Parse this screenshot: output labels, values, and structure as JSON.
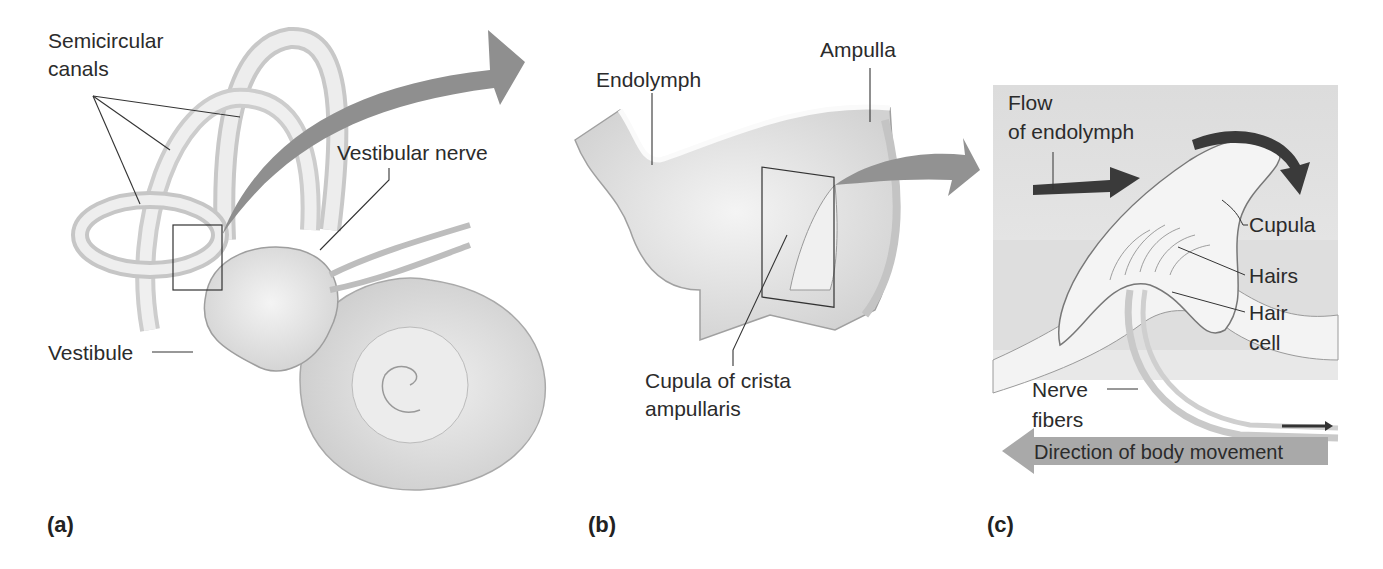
{
  "figure": {
    "panels": [
      {
        "id": "a",
        "letter": "(a)",
        "labels": {
          "semicircular_line1": "Semicircular",
          "semicircular_line2": "canals",
          "vestibular_nerve": "Vestibular nerve",
          "vestibule": "Vestibule"
        }
      },
      {
        "id": "b",
        "letter": "(b)",
        "labels": {
          "endolymph": "Endolymph",
          "ampulla": "Ampulla",
          "cupula_line1": "Cupula of crista",
          "cupula_line2": "ampullaris"
        }
      },
      {
        "id": "c",
        "letter": "(c)",
        "labels": {
          "flow_line1": "Flow",
          "flow_line2": "of endolymph",
          "cupula": "Cupula",
          "hairs": "Hairs",
          "hair_cell_line1": "Hair",
          "hair_cell_line2": "cell",
          "nerve_line1": "Nerve",
          "nerve_line2": "fibers",
          "direction": "Direction of body movement"
        }
      }
    ],
    "colors": {
      "arrow_gray": "#8c8c8c",
      "dark_arrow": "#3a3a3a",
      "panel_c_bg": "#d9d9d9",
      "tissue": "#e6e6e6"
    }
  }
}
